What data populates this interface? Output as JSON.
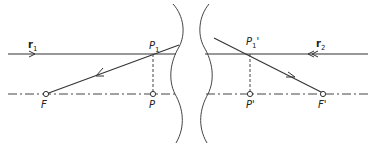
{
  "diagram": {
    "title": "",
    "colors": {
      "line": "#333333",
      "background": "#ffffff"
    },
    "rays": [
      {
        "id": "r1",
        "label": "r",
        "subscript": "1",
        "direction": "left-to-right",
        "arrow": "single"
      },
      {
        "id": "r2",
        "label": "r",
        "subscript": "2",
        "direction": "right-to-left",
        "arrow": "double"
      }
    ],
    "points": [
      {
        "id": "F",
        "label": "F"
      },
      {
        "id": "P",
        "label": "P"
      },
      {
        "id": "P1",
        "label": "P",
        "subscript": "1"
      },
      {
        "id": "P_prime",
        "label": "P'"
      },
      {
        "id": "P1_prime",
        "label": "P",
        "subscript": "1",
        "prime": "'"
      },
      {
        "id": "F_prime",
        "label": "F'"
      }
    ],
    "axis": {
      "style": "dash-dot",
      "label": "optical axis"
    },
    "surfaces": [
      {
        "id": "left-break",
        "style": "wavy"
      },
      {
        "id": "right-break",
        "style": "wavy"
      }
    ]
  }
}
